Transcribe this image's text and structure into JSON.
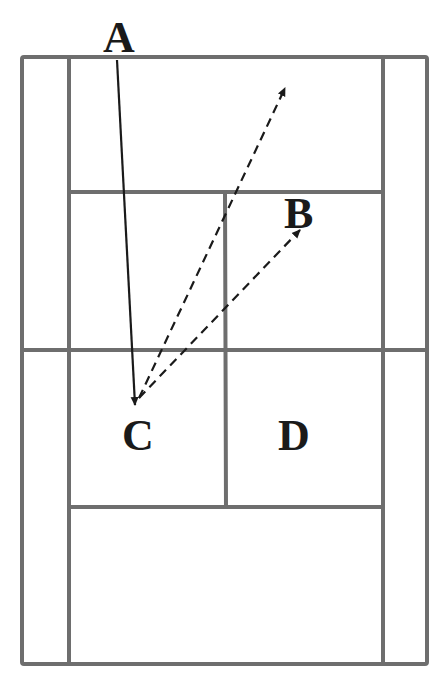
{
  "diagram": {
    "title_fragment": "m",
    "type": "badminton court diagram (top view)",
    "labels": {
      "A": "A",
      "B": "B",
      "C": "C",
      "D": "D"
    },
    "colors": {
      "court_lines": "#6e6e6e",
      "arrows": "#1a1a1a",
      "background": "#ffffff"
    },
    "arrows": [
      {
        "from": "A",
        "to": "C",
        "style": "solid"
      },
      {
        "from": "C",
        "to": "back-court (top)",
        "style": "dashed"
      },
      {
        "from": "C",
        "to": "B",
        "style": "dashed"
      }
    ]
  }
}
